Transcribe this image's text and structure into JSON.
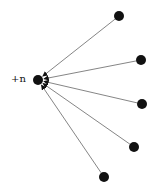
{
  "diagram": {
    "center": {
      "id": "center",
      "label": "+n",
      "x": 38,
      "y": 80,
      "r": 5
    },
    "nodes": [
      {
        "id": "n1",
        "x": 119,
        "y": 16,
        "r": 5
      },
      {
        "id": "n2",
        "x": 141,
        "y": 60,
        "r": 5
      },
      {
        "id": "n3",
        "x": 142,
        "y": 104,
        "r": 5
      },
      {
        "id": "n4",
        "x": 134,
        "y": 147,
        "r": 5
      },
      {
        "id": "n5",
        "x": 104,
        "y": 177,
        "r": 5
      }
    ],
    "edges": [
      {
        "from": "n1",
        "to": "center"
      },
      {
        "from": "n2",
        "to": "center"
      },
      {
        "from": "n3",
        "to": "center"
      },
      {
        "from": "n4",
        "to": "center"
      },
      {
        "from": "n5",
        "to": "center"
      }
    ],
    "colors": {
      "node": "#111111",
      "edge": "#777777",
      "arrowhead": "#111111"
    }
  }
}
